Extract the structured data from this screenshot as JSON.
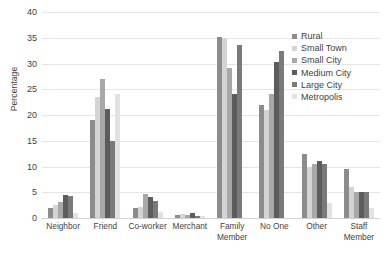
{
  "chart_data": {
    "type": "bar",
    "title": "",
    "xlabel": "",
    "ylabel": "Percentage",
    "ylim": [
      0,
      40
    ],
    "yticks": [
      0,
      5,
      10,
      15,
      20,
      25,
      30,
      35,
      40
    ],
    "grid": "horizontal",
    "legend_position": "top-right-inside",
    "categories": [
      "Neighbor",
      "Friend",
      "Co-worker",
      "Merchant",
      "Family\nMember",
      "No One",
      "Other",
      "Staff\nMember"
    ],
    "series": [
      {
        "name": "Rural",
        "color": "#8c8c8c",
        "values": [
          2.0,
          19.0,
          2.0,
          0.6,
          35.2,
          22.0,
          12.5,
          9.5
        ]
      },
      {
        "name": "Small Town",
        "color": "#d4d4d4",
        "values": [
          2.6,
          23.5,
          2.2,
          0.8,
          35.0,
          21.0,
          10.0,
          6.0
        ]
      },
      {
        "name": "Small City",
        "color": "#a8a8a8",
        "values": [
          3.2,
          27.0,
          4.6,
          0.5,
          29.2,
          24.0,
          10.5,
          5.0
        ]
      },
      {
        "name": "Medium City",
        "color": "#5c5c5c",
        "values": [
          4.4,
          21.2,
          4.0,
          0.9,
          24.0,
          30.2,
          11.0,
          5.0
        ]
      },
      {
        "name": "Large City",
        "color": "#7a7a7a",
        "values": [
          4.3,
          15.0,
          3.4,
          0.4,
          33.5,
          32.5,
          10.5,
          5.0
        ]
      },
      {
        "name": "Metropolis",
        "color": "#e2e2e2",
        "values": [
          1.0,
          24.0,
          1.2,
          0.3,
          0.0,
          0.0,
          3.0,
          2.0
        ]
      }
    ]
  }
}
